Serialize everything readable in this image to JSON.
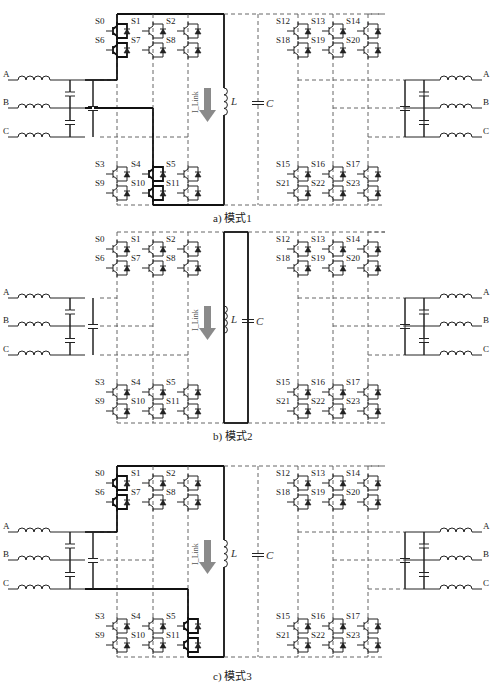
{
  "figure": {
    "panels": [
      {
        "id": "a",
        "caption": "a) 模式1",
        "mode": 1,
        "active_switches": [
          "S0",
          "S6",
          "S4",
          "S10"
        ],
        "highlighted_path": "left converter top + bottom rails to L"
      },
      {
        "id": "b",
        "caption": "b) 模式2",
        "mode": 2,
        "active_switches": [],
        "highlighted_path": "L freewheels in closed loop"
      },
      {
        "id": "c",
        "caption": "c) 模式3",
        "mode": 3,
        "active_switches": [
          "S0",
          "S6",
          "S5",
          "S11"
        ],
        "highlighted_path": "left converter top + bottom rails to L"
      }
    ],
    "left_top_switches": [
      {
        "top": "S0",
        "bottom": "S6"
      },
      {
        "top": "S1",
        "bottom": "S7"
      },
      {
        "top": "S2",
        "bottom": "S8"
      }
    ],
    "left_bottom_switches": [
      {
        "top": "S3",
        "bottom": "S9"
      },
      {
        "top": "S4",
        "bottom": "S10"
      },
      {
        "top": "S5",
        "bottom": "S11"
      }
    ],
    "right_top_switches": [
      {
        "top": "S12",
        "bottom": "S18"
      },
      {
        "top": "S13",
        "bottom": "S19"
      },
      {
        "top": "S14",
        "bottom": "S20"
      }
    ],
    "right_bottom_switches": [
      {
        "top": "S15",
        "bottom": "S21"
      },
      {
        "top": "S16",
        "bottom": "S22"
      },
      {
        "top": "S17",
        "bottom": "S23"
      }
    ],
    "phases": [
      "A",
      "B",
      "C"
    ],
    "inductor_label": "L",
    "capacitor_label": "C",
    "current_label": "I_Link"
  },
  "colors": {
    "arrow": "#8a8a8a",
    "wire": "#222222",
    "dashed": "#555555"
  }
}
